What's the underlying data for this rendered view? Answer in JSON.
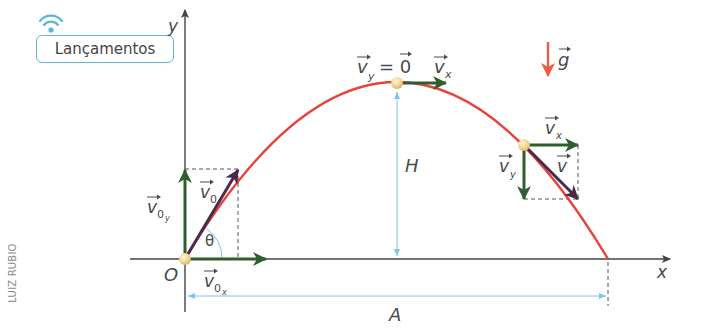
{
  "badge": {
    "label": "Lançamentos",
    "icon": "wifi-icon"
  },
  "credit": "LUIZ RUBIO",
  "axes": {
    "x_label": "x",
    "y_label": "y",
    "origin_label": "O"
  },
  "labels": {
    "v_y_top": "v",
    "v_y_top_sub": "y",
    "equals_zero": "= 0",
    "v_x_top": "v",
    "v_x_top_sub": "x",
    "gravity": "g",
    "height": "H",
    "range": "A",
    "v0": "v",
    "v0_sub": "0",
    "v0y": "v",
    "v0y_sub": "0",
    "v0y_subsub": "y",
    "v0x": "v",
    "v0x_sub": "0",
    "v0x_subsub": "x",
    "theta": "θ",
    "vx_right": "v",
    "vx_right_sub": "x",
    "vy_right": "v",
    "vy_right_sub": "y",
    "v_right": "v"
  },
  "colors": {
    "trajectory": "#e8423a",
    "component_vector": "#2e5d2e",
    "velocity_vector": "#4a2a4a",
    "gravity_arrow": "#ef5a45",
    "dimension_line": "#7cc6e8",
    "axis": "#444444",
    "ball": "#f1d48a"
  }
}
